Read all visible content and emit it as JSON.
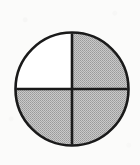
{
  "figure": {
    "shape": "circle",
    "accessible_label": "Circle divided into four equal quadrants; upper-right, lower-left and lower-right quadrants are shaded gray, upper-left quadrant is unshaded white.",
    "geometry": {
      "center_x": 72,
      "center_y": 89,
      "radius": 57,
      "outline_width": 2.6,
      "divider_width": 2.6
    },
    "colors": {
      "background": "#fbfbfa",
      "outline": "#1a1a1a",
      "divider": "#1a1a1a",
      "shaded_fill": "#bdbdbd",
      "shaded_dither_dark": "#8f8f8f",
      "unshaded_fill": "#ffffff"
    },
    "dividers": [
      {
        "name": "vertical-diameter",
        "orientation": "vertical",
        "from_angle_deg": 90,
        "to_angle_deg": 270
      },
      {
        "name": "horizontal-diameter",
        "orientation": "horizontal",
        "from_angle_deg": 0,
        "to_angle_deg": 180
      }
    ],
    "quadrants": [
      {
        "id": "upper-left",
        "position": "upper-left",
        "shaded": false,
        "fraction": "1/4",
        "angle_start_deg": 90,
        "angle_end_deg": 180
      },
      {
        "id": "upper-right",
        "position": "upper-right",
        "shaded": true,
        "fraction": "1/4",
        "angle_start_deg": 0,
        "angle_end_deg": 90
      },
      {
        "id": "lower-left",
        "position": "lower-left",
        "shaded": true,
        "fraction": "1/4",
        "angle_start_deg": 180,
        "angle_end_deg": 270
      },
      {
        "id": "lower-right",
        "position": "lower-right",
        "shaded": true,
        "fraction": "1/4",
        "angle_start_deg": 270,
        "angle_end_deg": 360
      }
    ],
    "summary": {
      "total_parts": 4,
      "shaded_parts": 3,
      "unshaded_parts": 1,
      "shaded_fraction": "3/4",
      "shaded_percent": "75%"
    }
  }
}
